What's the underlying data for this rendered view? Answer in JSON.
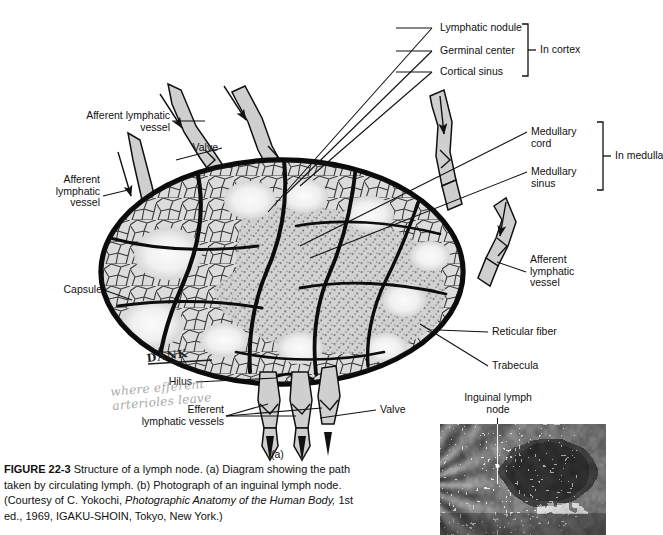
{
  "figure": {
    "panel_a_marker": "(a)",
    "caption_label": "FIGURE 22-3",
    "caption_text": " Structure of a lymph node. (a) Diagram showing the path taken by circulating lymph. (b) Photograph of an inguinal lymph node. (Courtesy of C. Yokochi, ",
    "caption_italic": "Photographic Anatomy of the Human Body,",
    "caption_tail": " 1st ed., 1969, IGAKU-SHOIN, Tokyo, New York.)"
  },
  "labels": {
    "lymphatic_nodule": "Lymphatic nodule",
    "germinal_center": "Germinal center",
    "cortical_sinus": "Cortical sinus",
    "in_cortex": "In cortex",
    "medullary_cord": "Medullary\ncord",
    "medullary_sinus": "Medullary\nsinus",
    "in_medulla": "In medulla",
    "afferent_top": "Afferent lymphatic\nvessel",
    "valve_top": "Valve",
    "afferent_left": "Afferent\nlymphatic\nvessel",
    "afferent_right": "Afferent\nlymphatic\nvessel",
    "capsule": "Capsule",
    "hilus": "Hilus",
    "reticular_fiber": "Reticular fiber",
    "trabecula": "Trabecula",
    "efferent_vessels": "Efferent\nlymphatic vessels",
    "valve_bottom": "Valve",
    "inguinal_lymph_node": "Inguinal lymph\nnode"
  },
  "annotations": {
    "initials": "DANK",
    "note_line1": "where efferent",
    "note_line2": "arterioles leave"
  },
  "colors": {
    "ink": "#111111",
    "node_fill": "#d8d8d8",
    "vessel_fill": "#cfcfcf",
    "pencil": "#9a9a9a",
    "background": "#ffffff"
  }
}
